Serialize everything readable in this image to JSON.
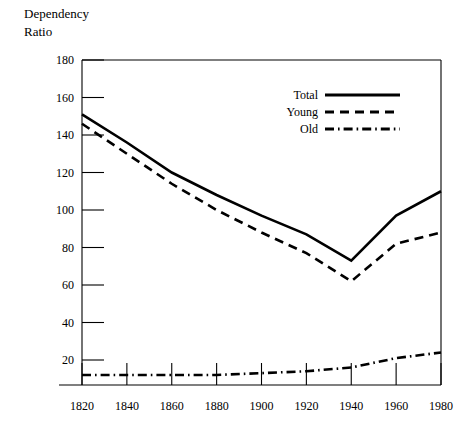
{
  "chart_data": {
    "type": "line",
    "title": "Dependency Ratio",
    "title_line1": "Dependency",
    "title_line2": "Ratio",
    "xlabel": "",
    "ylabel": "Dependency Ratio",
    "x": [
      1820,
      1840,
      1860,
      1880,
      1900,
      1920,
      1940,
      1960,
      1980
    ],
    "categories": [
      "1820",
      "1840",
      "1860",
      "1880",
      "1900",
      "1920",
      "1940",
      "1960",
      "1980"
    ],
    "xlim": [
      1810,
      1980
    ],
    "ylim": [
      -13,
      180
    ],
    "y_ticks": [
      20,
      40,
      60,
      80,
      100,
      120,
      140,
      160,
      180
    ],
    "x_ticks": [
      "1820",
      "1840",
      "1860",
      "1880",
      "1900",
      "1920",
      "1940",
      "1960",
      "1980"
    ],
    "grid": false,
    "legend_position": "top-right",
    "series": [
      {
        "name": "Total",
        "style": "solid",
        "color": "#000000",
        "values": [
          151,
          136,
          120,
          108,
          97,
          87,
          73,
          97,
          110
        ]
      },
      {
        "name": "Young",
        "style": "dashed",
        "color": "#000000",
        "values": [
          146,
          130,
          114,
          100,
          88,
          77,
          62,
          82,
          88
        ]
      },
      {
        "name": "Old",
        "style": "dash-dot",
        "color": "#000000",
        "values": [
          12,
          12,
          12,
          12,
          13,
          14,
          16,
          21,
          24
        ]
      }
    ]
  },
  "legend": {
    "items": [
      {
        "label": "Total",
        "style": "solid"
      },
      {
        "label": "Young",
        "style": "dashed"
      },
      {
        "label": "Old",
        "style": "dash-dot"
      }
    ]
  }
}
